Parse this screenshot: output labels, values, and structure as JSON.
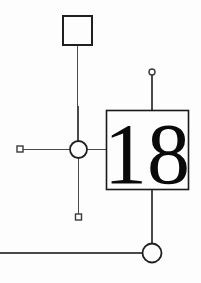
{
  "diagram": {
    "type": "schematic-node-link",
    "canvas": {
      "width": 201,
      "height": 283
    },
    "colors": {
      "background": "#fdfdfd",
      "stroke": "#4a4a4a",
      "node_stroke": "#1a1a1a",
      "label": "#0a0a0a"
    },
    "main_node": {
      "label": "18",
      "shape": "square",
      "x": 106,
      "y": 110,
      "width": 83,
      "height": 80
    },
    "nodes": [
      {
        "name": "top-square-node",
        "shape": "square",
        "label": "",
        "cx": 77.5,
        "cy": 30.5,
        "size": 29
      },
      {
        "name": "junction-circle",
        "shape": "circle",
        "label": "",
        "cx": 78.5,
        "cy": 149.5,
        "r": 8.5
      },
      {
        "name": "bottom-circle",
        "shape": "circle",
        "label": "",
        "cx": 152,
        "cy": 253,
        "r": 9.5
      }
    ],
    "terminals": [
      {
        "name": "left-square-terminal",
        "shape": "small-square",
        "cx": 20,
        "cy": 149,
        "size": 6
      },
      {
        "name": "bottom-square-terminal",
        "shape": "small-square",
        "cx": 78.5,
        "cy": 217,
        "size": 6
      },
      {
        "name": "top-circle-terminal",
        "shape": "small-circle",
        "cx": 152,
        "cy": 72,
        "r": 3
      }
    ],
    "edges": [
      {
        "name": "edge-top-square-to-junction",
        "x1": 77.5,
        "y1": 45,
        "x2": 78.5,
        "y2": 141
      },
      {
        "name": "edge-junction-to-bottom-terminal",
        "x1": 78.5,
        "y1": 158,
        "x2": 78.5,
        "y2": 214
      },
      {
        "name": "edge-left-terminal-to-junction",
        "x1": 23,
        "y1": 149,
        "x2": 70,
        "y2": 149.5
      },
      {
        "name": "edge-junction-to-main-node",
        "x1": 87,
        "y1": 149.5,
        "x2": 106,
        "y2": 149.5
      },
      {
        "name": "edge-top-terminal-to-main-node",
        "x1": 152,
        "y1": 75,
        "x2": 152,
        "y2": 110
      },
      {
        "name": "edge-main-node-to-bottom-circle",
        "x1": 152,
        "y1": 190,
        "x2": 152,
        "y2": 243.5
      },
      {
        "name": "edge-left-margin-to-bottom-circle",
        "x1": 0,
        "y1": 253,
        "x2": 142.5,
        "y2": 253
      }
    ]
  }
}
